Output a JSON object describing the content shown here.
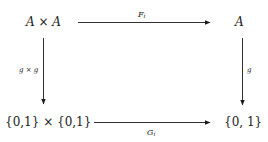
{
  "diagram": {
    "type": "commutative-square",
    "nodes": {
      "top_left": "A × A",
      "top_right": "A",
      "bottom_left": "{0,1} × {0,1}",
      "bottom_right": "{0, 1}"
    },
    "arrows": {
      "top": {
        "from": "top_left",
        "to": "top_right",
        "label": "F",
        "label_sub": "i"
      },
      "bottom": {
        "from": "bottom_left",
        "to": "bottom_right",
        "label": "G",
        "label_sub": "i"
      },
      "left": {
        "from": "top_left",
        "to": "bottom_left",
        "label": "g × g"
      },
      "right": {
        "from": "top_right",
        "to": "bottom_right",
        "label": "g"
      }
    },
    "colors": {
      "ink": "#1a1a1a",
      "background": "#ffffff"
    }
  }
}
